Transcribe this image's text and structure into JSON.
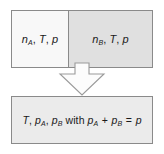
{
  "diagram": {
    "colors": {
      "chamber_a_fill": "#f8f8f8",
      "chamber_b_fill": "#e0e0e0",
      "result_fill": "#ebebeb",
      "border": "#8a8a8a",
      "arrow_fill": "#fcfcfc",
      "arrow_stroke": "#9a9a9a",
      "text": "#1a1a1a",
      "background": "#ffffff"
    },
    "top": {
      "chamber_a": {
        "amount_symbol": "n",
        "amount_subscript": "A",
        "temperature_symbol": "T",
        "pressure_symbol": "p",
        "separator_1": ", ",
        "separator_2": ", ",
        "label": "n_A, T, p"
      },
      "chamber_b": {
        "amount_symbol": "n",
        "amount_subscript": "B",
        "temperature_symbol": "T",
        "pressure_symbol": "p",
        "separator_1": ", ",
        "separator_2": ", ",
        "label": "n_B, T, p"
      }
    },
    "arrow": {
      "direction": "down",
      "icon": "down-block-arrow-icon"
    },
    "bottom": {
      "temperature_symbol": "T",
      "separator_1": ", ",
      "pressure_a_symbol": "p",
      "pressure_a_subscript": "A",
      "separator_2": ", ",
      "pressure_b_symbol": "p",
      "pressure_b_subscript": "B",
      "conjunction": " with ",
      "sum_a_symbol": "p",
      "sum_a_subscript": "A",
      "plus_operator": " + ",
      "sum_b_symbol": "p",
      "sum_b_subscript": "B",
      "equals_operator": " = ",
      "total_pressure_symbol": "p",
      "label": "T, p_A, p_B with p_A + p_B = p"
    }
  }
}
